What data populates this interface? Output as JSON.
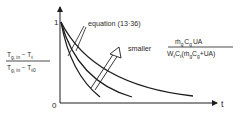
{
  "figure": {
    "y_axis": {
      "label_numerator": "T",
      "label_numerator_sub1": "g, in",
      "label_numerator_minus": " − T",
      "label_numerator_sub2": "ℓ",
      "label_denominator": "T",
      "label_denominator_sub1": "g, in",
      "label_denominator_minus": " − T",
      "label_denominator_sub2": "ℓ0",
      "top_tick": "1",
      "origin": "0"
    },
    "x_axis": {
      "label": "t"
    },
    "annotation": {
      "text": "equation (13·36)"
    },
    "parameter": {
      "prefix": "smaller",
      "numerator": "ṁ",
      "numerator_sub1": "g",
      "numerator_mid": "C",
      "numerator_sub2": "g",
      "numerator_end": "UA",
      "denominator": "W",
      "denominator_sub1": "ℓ",
      "denominator_mid": "C",
      "denominator_sub2": "ℓ",
      "denominator_paren_open": "(ṁ",
      "denominator_sub3": "g",
      "denominator_mid2": "C",
      "denominator_sub4": "g",
      "denominator_end": "+UA)"
    },
    "curves": [
      {
        "name": "fast-decay"
      },
      {
        "name": "medium-decay"
      },
      {
        "name": "slow-decay"
      }
    ],
    "colors": {
      "line": "#1e1e1e",
      "background": "#ffffff"
    }
  }
}
